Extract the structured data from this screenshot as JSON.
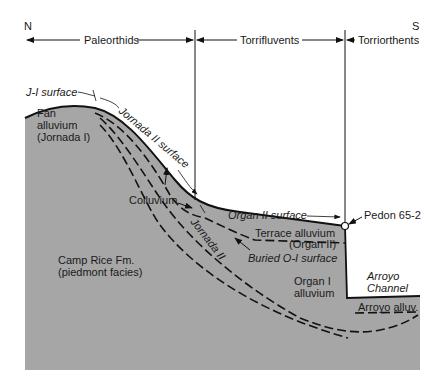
{
  "diagram": {
    "type": "geologic cross-section",
    "orientation": {
      "left": "N",
      "right": "S"
    },
    "soil_zones": [
      {
        "label": "Paleorthids"
      },
      {
        "label": "Torrifluvents"
      },
      {
        "label": "Torriorthents"
      }
    ],
    "surfaces": {
      "j1": "J-I surface",
      "j2": "Jornada II surface",
      "o2": "Organ II surface",
      "buried": "Buried O-I surface"
    },
    "units": {
      "fan_line1": "Fan",
      "fan_line2": "alluvium",
      "fan_line3": "(Jornada I)",
      "colluvium": "Colluvium",
      "jornada2": "Jornada II",
      "terrace_line1": "Terrace alluvium",
      "terrace_line2": "(Organ II)",
      "organ1_line1": "Organ I",
      "organ1_line2": "alluvium",
      "camp_line1": "Camp Rice Fm.",
      "camp_line2": "(piedmont facies)",
      "arroyo_line1": "Arroyo",
      "arroyo_line2": "Channel",
      "arroyo_alluv": "Arroyo alluv."
    },
    "pedon": "Pedon 65-2",
    "colors": {
      "fill": "#a6a6a6",
      "line": "#111111",
      "background": "#ffffff"
    }
  }
}
